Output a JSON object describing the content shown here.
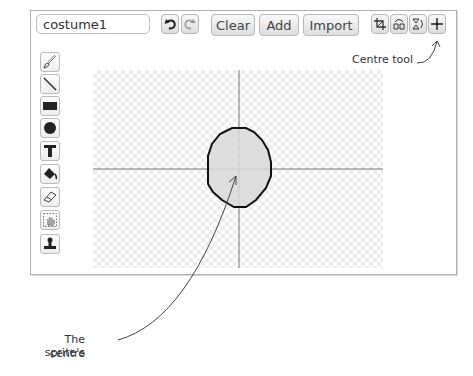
{
  "editor": {
    "costume_name": "costume1",
    "buttons": {
      "undo": "undo-icon",
      "redo": "redo-icon",
      "clear": "Clear",
      "add": "Add",
      "import": "Import"
    },
    "transform_tools": [
      "crop-icon",
      "flip-horizontal-icon",
      "flip-vertical-icon",
      "centre-icon"
    ],
    "paint_tools": [
      "paintbrush",
      "line",
      "rectangle",
      "ellipse",
      "text",
      "fill",
      "eraser",
      "select",
      "stamp"
    ]
  },
  "annotations": {
    "centre_tool": "Centre tool",
    "sprite_centre_line1": "The sprite's",
    "sprite_centre_line2": "centre"
  },
  "colors": {
    "shape_fill": "#d9d9d9",
    "shape_stroke": "#111111",
    "axis": "#777777"
  }
}
